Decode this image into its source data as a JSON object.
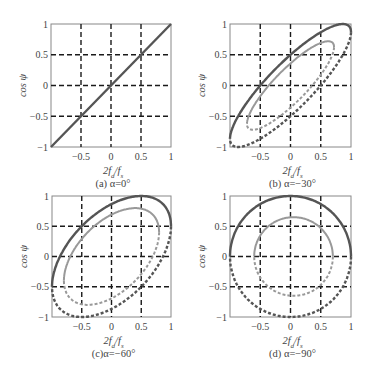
{
  "figure": {
    "xlabel": "2f_d / f_s",
    "ylabel": "cos ψ",
    "xtick_labels": [
      "-0.5",
      "0",
      "0.5",
      "1"
    ],
    "ytick_labels": [
      "1",
      "0.5",
      "0",
      "-0.5",
      "-1"
    ],
    "colors": {
      "outer_curve": "#555555",
      "inner_curve": "#999999",
      "grid": "#1a1a1a",
      "axes": "#888888"
    }
  },
  "chart_data": [
    {
      "type": "line",
      "panel": "a",
      "caption": "(a) α=0°",
      "alpha_deg": 0,
      "title": "",
      "xlabel": "2f_d/f_s",
      "ylabel": "cos ψ",
      "xlim": [
        -1,
        1
      ],
      "ylim": [
        -1,
        1
      ],
      "xticks": [
        -0.5,
        0,
        0.5,
        1
      ],
      "yticks": [
        -1,
        -0.5,
        0,
        0.5,
        1
      ],
      "grid": "dashed at ±0.5, 0",
      "series": [
        {
          "name": "outer",
          "style": "solid dark",
          "description": "straight line y=x from (-1,-1) to (1,1)",
          "x": [
            -1,
            -0.5,
            0,
            0.5,
            1
          ],
          "y": [
            -1,
            -0.5,
            0,
            0.5,
            1
          ]
        }
      ]
    },
    {
      "type": "line",
      "panel": "b",
      "caption": "(b) α=−30°",
      "alpha_deg": -30,
      "xlim": [
        -1,
        1
      ],
      "ylim": [
        -1,
        1
      ],
      "series": [
        {
          "name": "outer",
          "style": "dark; dashed upper-left half, solid lower-right half",
          "rx": 1.0,
          "cx": 0.0,
          "cy": 0.0,
          "points": {
            "top_right": [
              1,
              1
            ],
            "bottom_left": [
              -0.95,
              -0.95
            ],
            "x_at_y0": [
              -0.5,
              0.45
            ]
          }
        },
        {
          "name": "inner",
          "style": "light gray; dashed upper-left half, solid lower-right half",
          "rx": 0.72,
          "cx": 0.0,
          "cy": 0.0,
          "points": {
            "top_right": [
              0.7,
              0.7
            ],
            "bottom_left": [
              -0.68,
              -0.68
            ],
            "x_at_y0": [
              -0.3,
              0.3
            ]
          }
        }
      ]
    },
    {
      "type": "line",
      "panel": "c",
      "caption": "(c)α=−60°",
      "alpha_deg": -60,
      "xlim": [
        -1,
        1
      ],
      "ylim": [
        -1,
        1
      ],
      "series": [
        {
          "name": "outer",
          "style": "dark; dashed upper-left half, solid lower-right half",
          "rx": 1.0,
          "cx": 0.0,
          "cy": 0.0,
          "points": {
            "top": [
              0.5,
              1
            ],
            "bottom": [
              -0.5,
              -1
            ],
            "x_at_y0": [
              -0.87,
              0.87
            ]
          }
        },
        {
          "name": "inner",
          "style": "light gray; dashed upper-left half, solid lower-right half",
          "rx": 0.8,
          "cx": 0.0,
          "cy": 0.0,
          "points": {
            "top": [
              0.45,
              0.8
            ],
            "bottom": [
              -0.45,
              -0.8
            ],
            "x_at_y0": [
              -0.7,
              0.7
            ]
          }
        }
      ]
    },
    {
      "type": "line",
      "panel": "d",
      "caption": "(d) α=−90°",
      "alpha_deg": -90,
      "xlim": [
        -1,
        1
      ],
      "ylim": [
        -1,
        1
      ],
      "series": [
        {
          "name": "outer",
          "style": "dark; dashed left half, solid right half",
          "rx": 1.0,
          "cx": 0.0,
          "cy": 0.0,
          "points": {
            "circle_radius": 1.0
          }
        },
        {
          "name": "inner",
          "style": "light gray; dashed left half, solid right half",
          "rx": 0.65,
          "cx": 0.05,
          "cy": 0.0,
          "points": {
            "circle_radius": 0.63
          }
        }
      ]
    }
  ],
  "panels": [
    {
      "id": "a",
      "caption": "(a) α=0°",
      "box": [
        51,
        24,
        171,
        147
      ]
    },
    {
      "id": "b",
      "caption": "(b) α=−30°",
      "box": [
        230,
        24,
        351,
        147
      ]
    },
    {
      "id": "c",
      "caption": "(c)α=−60°",
      "box": [
        52,
        196,
        171,
        317
      ]
    },
    {
      "id": "d",
      "caption": "(d) α=−90°",
      "box": [
        230,
        196,
        351,
        317
      ]
    }
  ]
}
